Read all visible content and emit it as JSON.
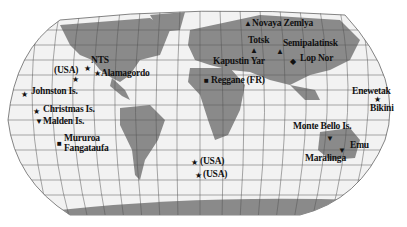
{
  "map": {
    "projection": "world map with graticule",
    "colors": {
      "ocean": "#f2f2f2",
      "land": "#8a8a8a",
      "grid": "#555555",
      "text": "#111111"
    },
    "sites": [
      {
        "name": "NTS",
        "marker": "star",
        "label": "NTS"
      },
      {
        "name": "usa-north",
        "marker": "star",
        "label": "(USA)"
      },
      {
        "name": "alamagordo",
        "marker": "star",
        "label": "Alamagordo"
      },
      {
        "name": "johnston",
        "marker": "star",
        "label": "Johnston Is."
      },
      {
        "name": "christmas",
        "marker": "star",
        "label": "Christmas Is."
      },
      {
        "name": "malden",
        "marker": "triangle-down",
        "label": "Malden Is."
      },
      {
        "name": "mururoa",
        "marker": "square",
        "label": "Mururoa"
      },
      {
        "name": "fangataufa",
        "marker": "square",
        "label": "Fangataufa"
      },
      {
        "name": "novaya-zemlya",
        "marker": "triangle",
        "label": "Novaya Zemlya"
      },
      {
        "name": "totsk",
        "marker": "triangle",
        "label": "Totsk"
      },
      {
        "name": "kapustin-yar",
        "marker": "triangle",
        "label": "Kapustin Yar"
      },
      {
        "name": "semipalatinsk",
        "marker": "triangle",
        "label": "Semipalatinsk"
      },
      {
        "name": "lop-nor",
        "marker": "diamond",
        "label": "Lop Nor"
      },
      {
        "name": "reggane",
        "marker": "square",
        "label": "Reggane (FR)"
      },
      {
        "name": "enewetak",
        "marker": "star",
        "label": "Enewetak"
      },
      {
        "name": "bikini",
        "marker": "star",
        "label": "Bikini"
      },
      {
        "name": "monte-bello",
        "marker": "triangle-down",
        "label": "Monte Bello Is."
      },
      {
        "name": "emu",
        "marker": "triangle-down",
        "label": "Emu"
      },
      {
        "name": "maralinga",
        "marker": "triangle-down",
        "label": "Maralinga"
      },
      {
        "name": "usa-atlantic-1",
        "marker": "star",
        "label": "(USA)"
      },
      {
        "name": "usa-atlantic-2",
        "marker": "star",
        "label": "(USA)"
      }
    ]
  }
}
